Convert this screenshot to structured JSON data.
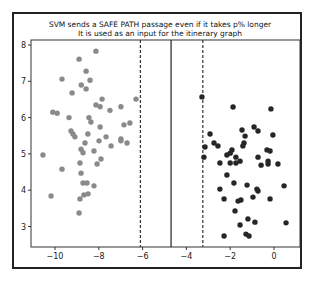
{
  "chart_data": {
    "type": "scatter",
    "title": "SVM sends a SAFE PATH passage even if it takes p% longer",
    "subtitle": "It is used as an input for the itinerary graph",
    "xlabel": "",
    "ylabel": "",
    "xlim": [
      -11.0,
      1.2
    ],
    "ylim": [
      2.4,
      8.1
    ],
    "grid": false,
    "legend": null,
    "x_ticks": [
      -10,
      -8,
      -6,
      -4,
      -2,
      0
    ],
    "x_tick_labels": [
      "−10",
      "−8",
      "−6",
      "−4",
      "−2",
      "0"
    ],
    "y_ticks": [
      3,
      4,
      5,
      6,
      7,
      8
    ],
    "y_tick_labels": [
      "3",
      "4",
      "5",
      "6",
      "7",
      "8"
    ],
    "decision_boundary": {
      "x": -4.7,
      "style": "solid"
    },
    "margins": [
      {
        "x": -6.1,
        "style": "dashed"
      },
      {
        "x": -3.25,
        "style": "dashed"
      }
    ],
    "series": [
      {
        "name": "class-A",
        "color": "#8a8a8a",
        "points": [
          [
            -8.13,
            7.83
          ],
          [
            -8.9,
            7.61
          ],
          [
            -8.58,
            7.28
          ],
          [
            -9.68,
            7.06
          ],
          [
            -8.4,
            7.03
          ],
          [
            -8.8,
            6.9
          ],
          [
            -8.58,
            6.79
          ],
          [
            -9.22,
            6.68
          ],
          [
            -7.85,
            6.51
          ],
          [
            -8.13,
            6.35
          ],
          [
            -7.94,
            6.3
          ],
          [
            -7.49,
            6.2
          ],
          [
            -6.99,
            6.3
          ],
          [
            -6.3,
            6.51
          ],
          [
            -10.1,
            6.15
          ],
          [
            -9.9,
            6.12
          ],
          [
            -9.36,
            6.0
          ],
          [
            -8.45,
            6.0
          ],
          [
            -8.36,
            5.88
          ],
          [
            -7.94,
            5.74
          ],
          [
            -6.85,
            5.8
          ],
          [
            -6.58,
            5.85
          ],
          [
            -9.27,
            5.63
          ],
          [
            -9.18,
            5.55
          ],
          [
            -9.09,
            5.47
          ],
          [
            -8.5,
            5.55
          ],
          [
            -7.67,
            5.47
          ],
          [
            -6.99,
            5.41
          ],
          [
            -6.71,
            5.3
          ],
          [
            -6.99,
            5.36
          ],
          [
            -7.99,
            5.36
          ],
          [
            -8.63,
            5.3
          ],
          [
            -7.44,
            5.22
          ],
          [
            -8.81,
            5.13
          ],
          [
            -8.22,
            5.08
          ],
          [
            -8.72,
            5.03
          ],
          [
            -10.55,
            4.97
          ],
          [
            -7.9,
            4.86
          ],
          [
            -8.86,
            4.75
          ],
          [
            -8.08,
            4.72
          ],
          [
            -9.68,
            4.58
          ],
          [
            -8.81,
            4.47
          ],
          [
            -8.72,
            4.2
          ],
          [
            -8.54,
            4.2
          ],
          [
            -8.22,
            4.12
          ],
          [
            -10.18,
            3.84
          ],
          [
            -8.68,
            3.87
          ],
          [
            -8.49,
            3.9
          ],
          [
            -8.86,
            3.76
          ],
          [
            -8.9,
            3.37
          ]
        ]
      },
      {
        "name": "class-B",
        "color": "#262626",
        "points": [
          [
            -3.29,
            6.57
          ],
          [
            -1.87,
            6.29
          ],
          [
            -0.14,
            6.24
          ],
          [
            -0.91,
            5.74
          ],
          [
            -1.46,
            5.66
          ],
          [
            -0.73,
            5.63
          ],
          [
            -2.92,
            5.55
          ],
          [
            -1.32,
            5.49
          ],
          [
            -0.05,
            5.52
          ],
          [
            -1.37,
            5.3
          ],
          [
            -1.42,
            5.22
          ],
          [
            -2.74,
            5.3
          ],
          [
            -2.56,
            5.22
          ],
          [
            -3.15,
            5.19
          ],
          [
            -1.92,
            5.11
          ],
          [
            -2.0,
            5.02
          ],
          [
            -2.15,
            4.97
          ],
          [
            -1.74,
            4.91
          ],
          [
            -0.32,
            5.11
          ],
          [
            -0.18,
            5.08
          ],
          [
            -0.73,
            4.91
          ],
          [
            -3.2,
            4.91
          ],
          [
            -0.27,
            4.8
          ],
          [
            -1.55,
            4.8
          ],
          [
            -2.47,
            4.75
          ],
          [
            -2.0,
            4.75
          ],
          [
            -1.74,
            4.75
          ],
          [
            -0.59,
            4.69
          ],
          [
            -0.27,
            4.72
          ],
          [
            0.18,
            4.72
          ],
          [
            -2.15,
            4.42
          ],
          [
            -1.83,
            4.2
          ],
          [
            -1.23,
            4.14
          ],
          [
            0.46,
            4.12
          ],
          [
            -2.47,
            4.03
          ],
          [
            -0.78,
            4.03
          ],
          [
            -0.73,
            3.98
          ],
          [
            -0.96,
            3.81
          ],
          [
            -2.28,
            3.76
          ],
          [
            -1.64,
            3.7
          ],
          [
            -1.51,
            3.73
          ],
          [
            -0.18,
            3.76
          ],
          [
            -1.78,
            3.43
          ],
          [
            -1.19,
            3.21
          ],
          [
            -0.87,
            3.12
          ],
          [
            0.55,
            3.1
          ],
          [
            -1.55,
            3.04
          ],
          [
            -2.28,
            2.74
          ],
          [
            -1.28,
            2.79
          ],
          [
            -1.14,
            2.74
          ]
        ]
      }
    ]
  },
  "colors": {
    "frame": "#222222",
    "axes": "#333333",
    "class_a": "#8a8a8a",
    "class_b": "#262626"
  }
}
